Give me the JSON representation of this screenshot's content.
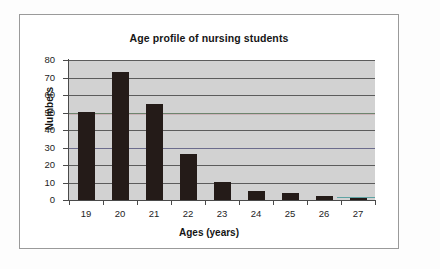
{
  "figure": {
    "border_color": "#9a9a9a",
    "canvas_color": "#ffffff"
  },
  "chart_data": {
    "type": "bar",
    "title": "Age profile of nursing students",
    "xlabel": "Ages (years)",
    "ylabel": "Numbers",
    "categories": [
      "19",
      "20",
      "21",
      "22",
      "23",
      "24",
      "25",
      "26",
      "27"
    ],
    "values": [
      50,
      73,
      55,
      26,
      10,
      5,
      4,
      2,
      1
    ],
    "yticks": [
      "80",
      "70",
      "60",
      "50",
      "40",
      "30",
      "20",
      "10",
      "0"
    ],
    "ylim": [
      0,
      80
    ],
    "grid": true,
    "legend": "none",
    "plot_background": "#d2d2d2",
    "bar_color": "#241b18",
    "gridline_color": "#5c5c5c"
  }
}
